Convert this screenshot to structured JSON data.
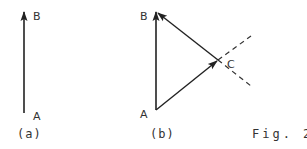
{
  "figure": {
    "caption": "Fig. 2",
    "colors": {
      "line": "#222222",
      "text": "#333333",
      "background": "#ffffff"
    },
    "panels": [
      {
        "id": "a",
        "label": "(a)",
        "points": {
          "A": "A",
          "B": "B"
        },
        "vectors": [
          {
            "from": "A",
            "to": "B",
            "style": "solid",
            "arrow": "end"
          }
        ]
      },
      {
        "id": "b",
        "label": "(b)",
        "points": {
          "A": "A",
          "B": "B",
          "C": "C"
        },
        "vectors": [
          {
            "from": "A",
            "to": "B",
            "style": "solid",
            "arrow": "end"
          },
          {
            "from": "A",
            "to": "C",
            "style": "solid",
            "arrow": "end"
          },
          {
            "from": "C",
            "to": "B",
            "style": "solid",
            "arrow": "end"
          }
        ],
        "construction_lines": [
          {
            "through": "C",
            "direction": "up-right",
            "style": "dashed"
          },
          {
            "through": "C",
            "direction": "down-right",
            "style": "dashed"
          }
        ]
      }
    ]
  }
}
